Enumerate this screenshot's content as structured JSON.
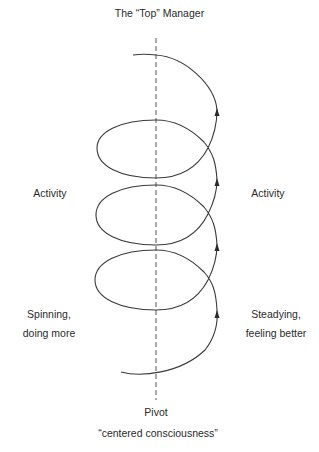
{
  "diagram": {
    "title": "The “Top” Manager",
    "left_labels": {
      "activity": "Activity",
      "bottom_line1": "Spinning,",
      "bottom_line2": "doing more"
    },
    "right_labels": {
      "activity": "Activity",
      "bottom_line1": "Steadying,",
      "bottom_line2": "feeling better"
    },
    "pivot_label": "Pivot",
    "pivot_caption": "“centered consciousness”",
    "elements": {
      "axis": "dashed vertical pivot axis",
      "spiral": "upward spiral with 3 full loops",
      "arrows": 4
    },
    "colors": {
      "line": "#3a3a3a",
      "background": "#ffffff"
    }
  }
}
